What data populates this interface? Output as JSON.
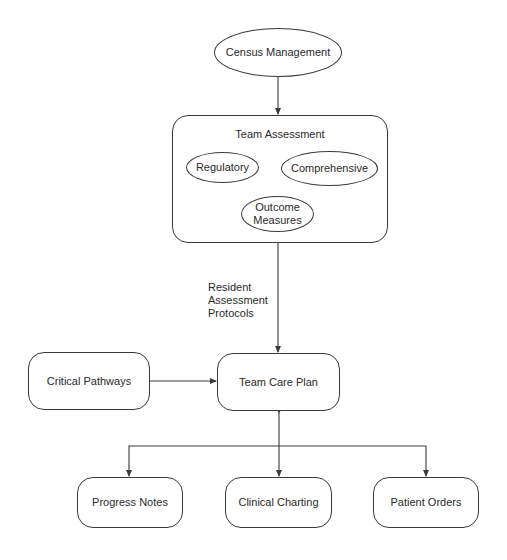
{
  "diagram": {
    "nodes": {
      "census_management": "Census Management",
      "team_assessment": {
        "title": "Team Assessment",
        "children": {
          "regulatory": "Regulatory",
          "comprehensive": "Comprehensive",
          "outcome_measures_line1": "Outcome",
          "outcome_measures_line2": "Measures"
        }
      },
      "critical_pathways": "Critical Pathways",
      "team_care_plan": "Team Care Plan",
      "progress_notes": "Progress Notes",
      "clinical_charting": "Clinical Charting",
      "patient_orders": "Patient Orders"
    },
    "edge_labels": {
      "assessment_to_care_plan_line1": "Resident",
      "assessment_to_care_plan_line2": "Assessment",
      "assessment_to_care_plan_line3": "Protocols"
    },
    "edges": [
      {
        "from": "Census Management",
        "to": "Team Assessment"
      },
      {
        "from": "Team Assessment",
        "to": "Team Care Plan",
        "label": "Resident Assessment Protocols"
      },
      {
        "from": "Critical Pathways",
        "to": "Team Care Plan"
      },
      {
        "from": "Team Care Plan",
        "to": "Progress Notes"
      },
      {
        "from": "Team Care Plan",
        "to": "Clinical Charting",
        "bidirectional": true
      },
      {
        "from": "Team Care Plan",
        "to": "Patient Orders"
      }
    ],
    "colors": {
      "stroke": "#3a3a3a",
      "text": "#2a2a2a",
      "background": "#ffffff"
    }
  }
}
